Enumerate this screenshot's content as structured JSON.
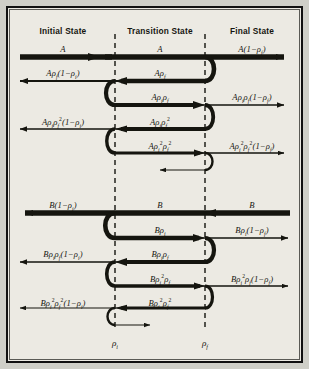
{
  "figure": {
    "type": "ray-diagram",
    "background_color": "#eceae3",
    "ink_color": "#15150f"
  },
  "columns": {
    "initial": {
      "header": "Initial State",
      "x": 63
    },
    "transition": {
      "header": "Transition State",
      "x": 160
    },
    "final": {
      "header": "Final State",
      "x": 252
    }
  },
  "interfaces": [
    {
      "name": "rho-i-interface",
      "label_html": "ρ<sub>i</sub>",
      "x": 115
    },
    {
      "name": "rho-f-interface",
      "label_html": "ρ<sub>f</sub>",
      "x": 205
    }
  ],
  "axis_labels": [
    {
      "name": "axis-label-rho-i",
      "text_html": "ρ<sub>i</sub>",
      "x": 115,
      "y": 338
    },
    {
      "name": "axis-label-rho-f",
      "text_html": "ρ<sub>f</sub>",
      "x": 205,
      "y": 338
    }
  ],
  "beam_A": {
    "name": "beam-group-A",
    "labels": [
      {
        "name": "label-A-initial",
        "html": "A",
        "x": 63,
        "y": 44,
        "align": "center"
      },
      {
        "name": "label-A-transition",
        "html": "A",
        "x": 160,
        "y": 44,
        "align": "center"
      },
      {
        "name": "label-A-final",
        "html": "A(1−ρ<sub>f</sub>)",
        "x": 252,
        "y": 44,
        "align": "center"
      },
      {
        "name": "label-A-refl1-left",
        "html": "Aρ<sub>f</sub>(1−ρ<sub>i</sub>)",
        "x": 63,
        "y": 68,
        "align": "center"
      },
      {
        "name": "label-A-refl1-mid",
        "html": "Aρ<sub>f</sub>",
        "x": 160,
        "y": 68,
        "align": "center"
      },
      {
        "name": "label-A-trans2-mid",
        "html": "Aρ<sub>i</sub>ρ<sub>f</sub>",
        "x": 160,
        "y": 92,
        "align": "center"
      },
      {
        "name": "label-A-trans2-right",
        "html": "Aρ<sub>i</sub>ρ<sub>f</sub>(1−ρ<sub>f</sub>)",
        "x": 252,
        "y": 92,
        "align": "center"
      },
      {
        "name": "label-A-refl2-left",
        "html": "Aρ<sub>i</sub>ρ<sub>f</sub><sup>2</sup>(1−ρ<sub>i</sub>)",
        "x": 63,
        "y": 116,
        "align": "center"
      },
      {
        "name": "label-A-refl2-mid",
        "html": "Aρ<sub>i</sub>ρ<sub>f</sub><sup>2</sup>",
        "x": 160,
        "y": 116,
        "align": "center"
      },
      {
        "name": "label-A-trans3-mid",
        "html": "Aρ<sub>i</sub><sup>2</sup>ρ<sub>f</sub><sup>2</sup>",
        "x": 160,
        "y": 140,
        "align": "center"
      },
      {
        "name": "label-A-trans3-right",
        "html": "Aρ<sub>i</sub><sup>2</sup>ρ<sub>f</sub><sup>2</sup>(1−ρ<sub>f</sub>)",
        "x": 252,
        "y": 140,
        "align": "center"
      }
    ]
  },
  "beam_B": {
    "name": "beam-group-B",
    "labels": [
      {
        "name": "label-B-left",
        "html": "B(1−ρ<sub>i</sub>)",
        "x": 63,
        "y": 200,
        "align": "center"
      },
      {
        "name": "label-B-transition",
        "html": "B",
        "x": 160,
        "y": 200,
        "align": "center"
      },
      {
        "name": "label-B-final",
        "html": "B",
        "x": 252,
        "y": 200,
        "align": "center"
      },
      {
        "name": "label-B-mid1",
        "html": "Bρ<sub>i</sub>",
        "x": 160,
        "y": 225,
        "align": "center"
      },
      {
        "name": "label-B-right1",
        "html": "Bρ<sub>i</sub>(1−ρ<sub>f</sub>)",
        "x": 252,
        "y": 225,
        "align": "center"
      },
      {
        "name": "label-B-left2",
        "html": "Bρ<sub>i</sub>ρ<sub>f</sub>(1−ρ<sub>i</sub>)",
        "x": 63,
        "y": 249,
        "align": "center"
      },
      {
        "name": "label-B-mid2",
        "html": "Bρ<sub>i</sub>ρ<sub>f</sub>",
        "x": 160,
        "y": 249,
        "align": "center"
      },
      {
        "name": "label-B-mid3",
        "html": "Bρ<sub>i</sub><sup>2</sup>ρ<sub>f</sub>",
        "x": 160,
        "y": 273,
        "align": "center"
      },
      {
        "name": "label-B-right3",
        "html": "Bρ<sub>i</sub><sup>2</sup>ρ<sub>f</sub>(1−ρ<sub>f</sub>)",
        "x": 252,
        "y": 273,
        "align": "center"
      },
      {
        "name": "label-B-left4",
        "html": "Bρ<sub>i</sub><sup>2</sup>ρ<sub>f</sub><sup>2</sup>(1−ρ<sub>i</sub>)",
        "x": 63,
        "y": 297,
        "align": "center"
      },
      {
        "name": "label-B-mid4",
        "html": "Bρ<sub>i</sub><sup>2</sup>ρ<sub>f</sub><sup>2</sup>",
        "x": 160,
        "y": 297,
        "align": "center"
      }
    ]
  }
}
